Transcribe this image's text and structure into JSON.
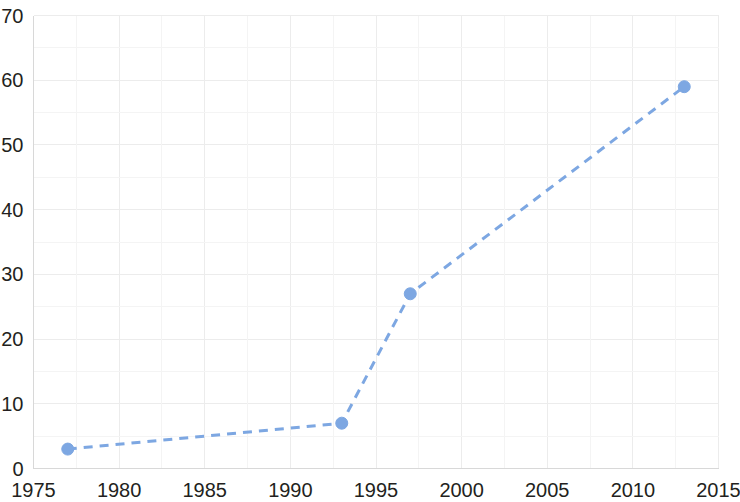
{
  "chart_data": {
    "type": "line",
    "title": "",
    "subtitle": "",
    "xlabel": "",
    "ylabel": "",
    "x": [
      1977,
      1993,
      1997,
      2013
    ],
    "values": [
      3,
      7,
      27,
      59
    ],
    "series": [
      {
        "name": "",
        "x": [
          1977,
          1993,
          1997,
          2013
        ],
        "values": [
          3,
          7,
          27,
          59
        ],
        "color": "#7da7e2",
        "line_style": "dashed",
        "marker": "circle"
      }
    ],
    "xlim": [
      1975,
      2015
    ],
    "ylim": [
      0,
      70
    ],
    "xticks": [
      1975,
      1980,
      1985,
      1990,
      1995,
      2000,
      2005,
      2010,
      2015
    ],
    "yticks": [
      0,
      10,
      20,
      30,
      40,
      50,
      60,
      70
    ],
    "xtick_labels": [
      "1975",
      "1980",
      "1985",
      "1990",
      "1995",
      "2000",
      "2005",
      "2010",
      "2015"
    ],
    "ytick_labels": [
      "0",
      "10",
      "20",
      "30",
      "40",
      "50",
      "60",
      "70"
    ],
    "grid": true,
    "grid_color": "#ececec",
    "grid_minor_color": "#f4f4f4",
    "legend": null,
    "legend_position": "none",
    "background_color": "#ffffff",
    "axis_color": "#d8d8d8",
    "tick_label_color": "#231f20"
  }
}
